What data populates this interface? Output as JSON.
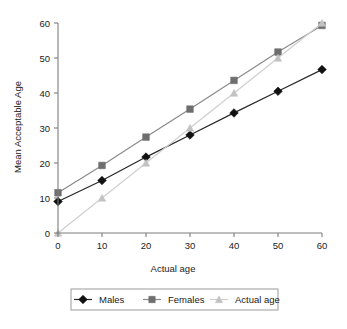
{
  "chart_data": {
    "type": "line",
    "title": "",
    "xlabel": "Actual age",
    "ylabel": "Mean Acceptable Age",
    "x": [
      0,
      10,
      20,
      30,
      40,
      50,
      60
    ],
    "xlim": [
      0,
      60
    ],
    "ylim": [
      0,
      60
    ],
    "xticks": [
      "0",
      "10",
      "20",
      "30",
      "40",
      "50",
      "60"
    ],
    "yticks": [
      "0",
      "10",
      "20",
      "30",
      "40",
      "50",
      "60"
    ],
    "grid": false,
    "legend_position": "bottom",
    "series": [
      {
        "name": "Males",
        "marker": "diamond",
        "color": "#111111",
        "line_color": "#2a2a2a",
        "values": [
          9.0,
          15.0,
          21.7,
          28.0,
          34.3,
          40.5,
          46.7
        ]
      },
      {
        "name": "Females",
        "marker": "square",
        "color": "#6e6e6e",
        "line_color": "#8a8a8a",
        "values": [
          11.5,
          19.3,
          27.4,
          35.4,
          43.6,
          51.7,
          59.3
        ]
      },
      {
        "name": "Actual age",
        "marker": "triangle",
        "color": "#c2c2c2",
        "line_color": "#cfcfcf",
        "values": [
          0,
          10,
          20,
          30,
          40,
          50,
          60
        ]
      }
    ]
  },
  "axes": {
    "x_label": "Actual age",
    "y_label": "Mean Acceptable Age",
    "x_tick_labels": [
      "0",
      "10",
      "20",
      "30",
      "40",
      "50",
      "60"
    ],
    "y_tick_labels": [
      "0",
      "10",
      "20",
      "30",
      "40",
      "50",
      "60"
    ]
  },
  "legend": {
    "items": [
      {
        "label": "Males",
        "marker": "diamond-marker-icon",
        "color": "#111111"
      },
      {
        "label": "Females",
        "marker": "square-marker-icon",
        "color": "#6e6e6e"
      },
      {
        "label": "Actual age",
        "marker": "triangle-marker-icon",
        "color": "#c2c2c2"
      }
    ]
  },
  "colors": {
    "males": "#111111",
    "females": "#6e6e6e",
    "actual": "#c2c2c2",
    "axis": "#7d7d7d",
    "text": "#1b1b1b",
    "legend_border": "#9a9a9a",
    "background": "#ffffff"
  }
}
